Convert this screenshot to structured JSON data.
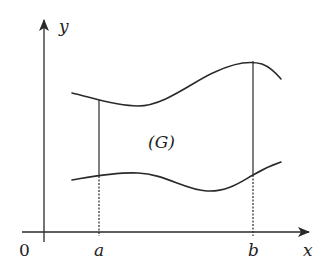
{
  "diagram": {
    "type": "region-between-curves",
    "axes": {
      "x_label": "x",
      "y_label": "y",
      "origin_label": "0"
    },
    "bounds": {
      "left_label": "a",
      "right_label": "b"
    },
    "region_label": "(G)",
    "curves": [
      {
        "name": "upper-curve",
        "description": "upper boundary y = φ2(x)"
      },
      {
        "name": "lower-curve",
        "description": "lower boundary y = φ1(x)"
      }
    ],
    "colors": {
      "stroke": "#2a2a2a",
      "background": "#ffffff"
    }
  }
}
